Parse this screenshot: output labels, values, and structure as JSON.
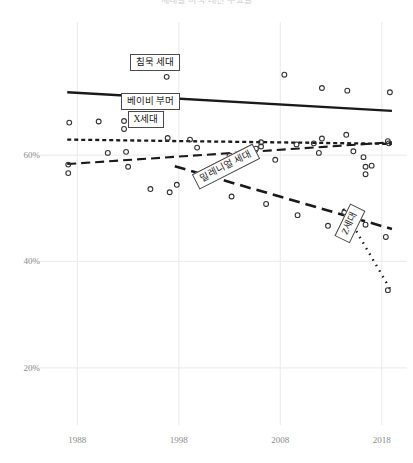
{
  "chart_title": "세대별 미국 대선 투표율",
  "axes": {
    "y_ticks": [
      "60%",
      "40%",
      "20%"
    ],
    "y_values": [
      60,
      40,
      20
    ],
    "x_ticks": [
      "1988",
      "1998",
      "2008",
      "2018"
    ],
    "x_values": [
      1988,
      1998,
      2008,
      2018
    ],
    "ylim": [
      10,
      82
    ],
    "xlim": [
      1985.5,
      2019.5
    ],
    "grid": true
  },
  "labels": {
    "silent": "침묵 세대",
    "boomer": "베이비 부머",
    "genx": "X세대",
    "millennial": "밀레니얼 세대",
    "genz": "Z세대"
  },
  "colors": {
    "line": "#1a1a1a",
    "point": "#333333",
    "grid": "#ededf1",
    "tick_text": "#8a8a90",
    "label_border": "#4a4a4a",
    "label_bg": "#ffffff"
  },
  "chart_data": {
    "type": "line",
    "title": "세대별 미국 대선 투표율",
    "xlabel": "",
    "ylabel": "",
    "ylim": [
      10,
      82
    ],
    "xlim": [
      1985.5,
      2019.5
    ],
    "grid": true,
    "legend": "inline-labels",
    "series": [
      {
        "name": "침묵 세대",
        "style": "solid",
        "trend": [
          {
            "x": 1987.0,
            "y": 71.8
          },
          {
            "x": 2019.0,
            "y": 68.3
          }
        ],
        "points": [
          {
            "x": 1987.2,
            "y": 66.1
          },
          {
            "x": 1990.1,
            "y": 66.3
          },
          {
            "x": 1992.6,
            "y": 66.4
          },
          {
            "x": 1992.6,
            "y": 64.9
          },
          {
            "x": 1994.0,
            "y": 77.3
          },
          {
            "x": 1996.8,
            "y": 74.7
          },
          {
            "x": 1996.9,
            "y": 63.2
          },
          {
            "x": 1999.1,
            "y": 62.9
          },
          {
            "x": 2008.4,
            "y": 75.1
          },
          {
            "x": 2012.1,
            "y": 72.6
          },
          {
            "x": 2014.6,
            "y": 72.1
          },
          {
            "x": 2018.8,
            "y": 71.8
          },
          {
            "x": 2006.1,
            "y": 62.4
          },
          {
            "x": 2006.1,
            "y": 61.6
          },
          {
            "x": 2011.3,
            "y": 62.2
          }
        ]
      },
      {
        "name": "베이비 부머",
        "style": "dotted",
        "trend": [
          {
            "x": 1987.0,
            "y": 62.9
          },
          {
            "x": 2019.0,
            "y": 62.1
          }
        ],
        "points": [
          {
            "x": 1992.8,
            "y": 60.6
          },
          {
            "x": 1999.8,
            "y": 61.4
          },
          {
            "x": 2003.0,
            "y": 59.9
          },
          {
            "x": 2005.6,
            "y": 61.2
          },
          {
            "x": 2009.6,
            "y": 62.0
          },
          {
            "x": 2012.1,
            "y": 63.1
          },
          {
            "x": 2014.5,
            "y": 63.8
          },
          {
            "x": 2018.7,
            "y": 62.2
          },
          {
            "x": 2016.2,
            "y": 59.6
          },
          {
            "x": 2017.0,
            "y": 58.0
          }
        ]
      },
      {
        "name": "X세대",
        "style": "dashed",
        "trend": [
          {
            "x": 1987.0,
            "y": 58.3
          },
          {
            "x": 2019.0,
            "y": 62.4
          }
        ],
        "points": [
          {
            "x": 1987.1,
            "y": 58.2
          },
          {
            "x": 1987.1,
            "y": 56.6
          },
          {
            "x": 1991.0,
            "y": 60.4
          },
          {
            "x": 1993.0,
            "y": 57.8
          },
          {
            "x": 1995.2,
            "y": 53.6
          },
          {
            "x": 1997.1,
            "y": 53.0
          },
          {
            "x": 2000.2,
            "y": 54.6
          },
          {
            "x": 2003.8,
            "y": 58.8
          },
          {
            "x": 2007.5,
            "y": 59.1
          },
          {
            "x": 2011.8,
            "y": 60.4
          },
          {
            "x": 2015.2,
            "y": 60.7
          },
          {
            "x": 2018.6,
            "y": 62.6
          },
          {
            "x": 2016.4,
            "y": 57.8
          },
          {
            "x": 2016.4,
            "y": 56.4
          }
        ]
      },
      {
        "name": "밀레니얼 세대",
        "style": "dashed-heavy",
        "trend": [
          {
            "x": 1997.6,
            "y": 57.9
          },
          {
            "x": 2019.0,
            "y": 46.1
          }
        ],
        "points": [
          {
            "x": 1997.8,
            "y": 54.4
          },
          {
            "x": 2000.6,
            "y": 56.4
          },
          {
            "x": 2003.2,
            "y": 52.2
          },
          {
            "x": 2006.6,
            "y": 50.8
          },
          {
            "x": 2009.7,
            "y": 48.7
          },
          {
            "x": 2012.7,
            "y": 46.7
          },
          {
            "x": 2015.6,
            "y": 48.9
          },
          {
            "x": 2016.4,
            "y": 46.9
          },
          {
            "x": 2018.4,
            "y": 44.6
          }
        ]
      },
      {
        "name": "Z세대",
        "style": "fine-dotted",
        "trend": [
          {
            "x": 2014.2,
            "y": 49.9
          },
          {
            "x": 2018.8,
            "y": 34.9
          }
        ],
        "points": [
          {
            "x": 2014.3,
            "y": 49.2
          },
          {
            "x": 2018.6,
            "y": 34.6
          }
        ]
      }
    ]
  }
}
